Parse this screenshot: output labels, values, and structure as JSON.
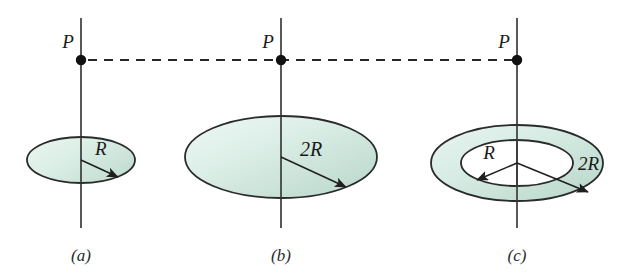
{
  "figure": {
    "background_color": "#ffffff",
    "disk_fill_light": "#e8f4ef",
    "disk_fill_dark": "#c4ded3",
    "outline_color": "#2b2b2b",
    "axis_color": "#3b3b3b",
    "dash_color": "#262626",
    "point_color": "#111111"
  },
  "panels": [
    {
      "id": "a",
      "caption": "(a)",
      "point_label": "P",
      "radius_label": "R",
      "shape": "disk",
      "axis": {
        "x": 81,
        "y_top": 18,
        "y_bottom": 228
      },
      "point": {
        "x": 81,
        "y": 60
      },
      "disk": {
        "cx": 81,
        "cy": 160,
        "rx": 54,
        "ry": 23
      },
      "radius_arrow": {
        "x1": 81,
        "y1": 160,
        "x2": 118,
        "y2": 177
      },
      "label_pos": {
        "x": 95,
        "y": 155
      },
      "caption_pos": {
        "x": 81,
        "y": 261
      }
    },
    {
      "id": "b",
      "caption": "(b)",
      "point_label": "P",
      "radius_label": "2R",
      "shape": "disk",
      "axis": {
        "x": 281,
        "y_top": 18,
        "y_bottom": 228
      },
      "point": {
        "x": 281,
        "y": 60
      },
      "disk": {
        "cx": 281,
        "cy": 157,
        "rx": 96,
        "ry": 41
      },
      "radius_arrow": {
        "x1": 281,
        "y1": 157,
        "x2": 346,
        "y2": 187
      },
      "label_pos": {
        "x": 300,
        "y": 155
      },
      "caption_pos": {
        "x": 281,
        "y": 261
      }
    },
    {
      "id": "c",
      "caption": "(c)",
      "point_label": "P",
      "inner_radius_label": "R",
      "outer_radius_label": "2R",
      "shape": "annulus",
      "axis": {
        "x": 517,
        "y_top": 18,
        "y_bottom": 228
      },
      "point": {
        "x": 517,
        "y": 60
      },
      "outer": {
        "cx": 517,
        "cy": 163,
        "rx": 86,
        "ry": 38
      },
      "inner": {
        "cx": 517,
        "cy": 163,
        "rx": 56,
        "ry": 23
      },
      "inner_arrow": {
        "x1": 517,
        "y1": 163,
        "x2": 477,
        "y2": 180
      },
      "outer_arrow": {
        "x1": 517,
        "y1": 163,
        "x2": 588,
        "y2": 192
      },
      "inner_label_pos": {
        "x": 489,
        "y": 158
      },
      "outer_label_pos": {
        "x": 580,
        "y": 168
      },
      "caption_pos": {
        "x": 517,
        "y": 261
      }
    }
  ],
  "connector": {
    "description": "horizontal dashed line joining the three P points",
    "y": 60,
    "x_start": 88,
    "x_end": 512
  }
}
